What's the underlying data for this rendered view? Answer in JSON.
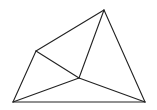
{
  "diagram": {
    "type": "geometric-figure",
    "stroke_color": "#222222",
    "background": "#ffffff",
    "vertices": {
      "top": [
        104,
        10
      ],
      "left": [
        36,
        51
      ],
      "center": [
        79,
        78
      ],
      "bottom_left": [
        13,
        102
      ],
      "bottom_right": [
        145,
        102
      ]
    },
    "edges": [
      [
        "top",
        "left"
      ],
      [
        "top",
        "bottom_right"
      ],
      [
        "left",
        "bottom_left"
      ],
      [
        "bottom_left",
        "bottom_right"
      ],
      [
        "top",
        "center"
      ],
      [
        "left",
        "center"
      ],
      [
        "center",
        "bottom_left"
      ],
      [
        "center",
        "bottom_right"
      ]
    ]
  }
}
